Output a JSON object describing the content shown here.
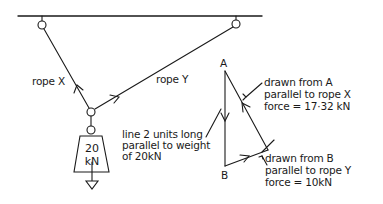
{
  "diagram": {
    "rope_x_label": "rope X",
    "rope_y_label": "rope Y",
    "weight": {
      "value": "20",
      "unit": "kN"
    },
    "vertex_a": "A",
    "vertex_b": "B",
    "note_weight": [
      "line 2 units long",
      "parallel to weight",
      "of 20kN"
    ],
    "note_a": [
      "drawn from A",
      "parallel to rope X",
      "force = 17·32 kN"
    ],
    "note_b": [
      "drawn from B",
      "parallel to rope Y",
      "force = 10kN"
    ]
  },
  "colors": {
    "ink": "#1a1a1a",
    "background": "#ffffff"
  }
}
